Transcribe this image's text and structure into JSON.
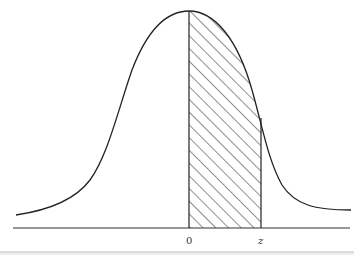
{
  "diagram": {
    "axis_labels": {
      "origin": "0",
      "z": "z"
    },
    "shaded_region": {
      "from": "0",
      "to": "z",
      "pattern": "diagonal hatching"
    },
    "colors": {
      "curve": "#222222",
      "hatch": "#333333",
      "baseline": "#333333",
      "rule": "#bbbbbb"
    }
  }
}
